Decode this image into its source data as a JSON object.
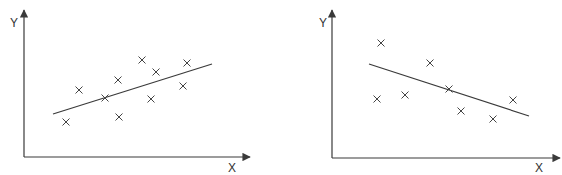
{
  "chart_data": [
    {
      "type": "scatter",
      "title": "",
      "xlabel": "X",
      "ylabel": "Y",
      "grid": false,
      "legend": null,
      "trend": "positive",
      "marker": "x",
      "axis_origin_px": [
        24,
        157
      ],
      "axis_end_px": {
        "x": 250,
        "y": 10
      },
      "points_px": [
        [
          66,
          122
        ],
        [
          79,
          90
        ],
        [
          105,
          98
        ],
        [
          118,
          80
        ],
        [
          119,
          117
        ],
        [
          142,
          60
        ],
        [
          156,
          72
        ],
        [
          151,
          99
        ],
        [
          187,
          63
        ],
        [
          183,
          86
        ]
      ],
      "fit_line_px": [
        [
          53,
          114
        ],
        [
          212,
          64
        ]
      ]
    },
    {
      "type": "scatter",
      "title": "",
      "xlabel": "X",
      "ylabel": "Y",
      "grid": false,
      "legend": null,
      "trend": "negative",
      "marker": "x",
      "axis_origin_px": [
        332,
        158
      ],
      "axis_end_px": {
        "x": 560,
        "y": 10
      },
      "points_px": [
        [
          381,
          43
        ],
        [
          377,
          99
        ],
        [
          405,
          95
        ],
        [
          430,
          63
        ],
        [
          449,
          89
        ],
        [
          461,
          111
        ],
        [
          493,
          119
        ],
        [
          513,
          100
        ]
      ],
      "fit_line_px": [
        [
          369,
          64
        ],
        [
          529,
          116
        ]
      ]
    }
  ],
  "charts": [
    {
      "xlabel": "X",
      "ylabel": "Y"
    },
    {
      "xlabel": "X",
      "ylabel": "Y"
    }
  ]
}
